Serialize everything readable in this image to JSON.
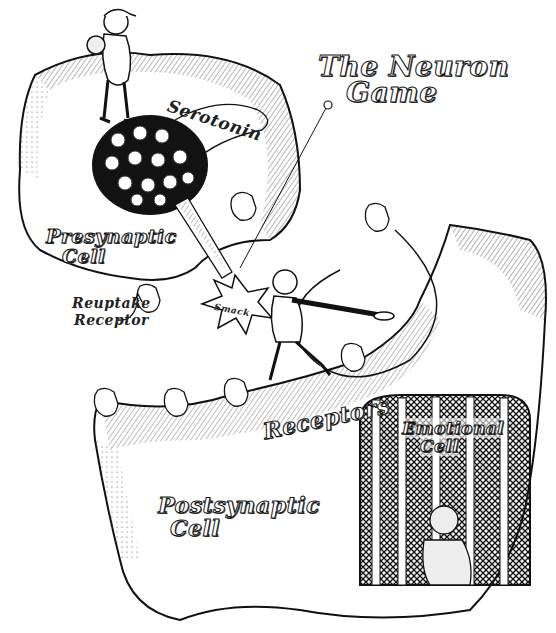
{
  "title": {
    "line1": "The Neuron",
    "line2": "Game"
  },
  "labels": {
    "serotonin": "Serotonin",
    "presynaptic_line1": "Presynaptic",
    "presynaptic_line2": "Cell",
    "reuptake_line1": "Reuptake",
    "reuptake_line2": "Receptor",
    "smack": "Smack",
    "receptors": "Receptors",
    "postsynaptic_line1": "Postsynaptic",
    "postsynaptic_line2": "Cell",
    "emotional_line1": "Emotional",
    "emotional_line2": "Cell"
  },
  "colors": {
    "ink": "#111111",
    "paper": "#ffffff",
    "shade": "#cfcfcf"
  }
}
